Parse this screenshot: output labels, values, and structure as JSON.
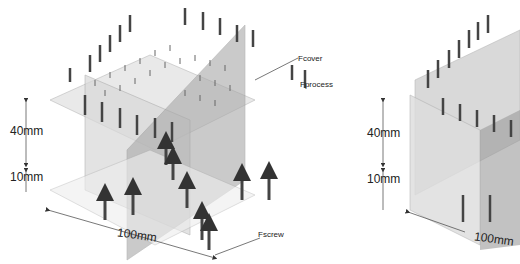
{
  "left_figure": {
    "dimensions": {
      "height_top": "40mm",
      "height_bottom": "10mm",
      "width": "100mm"
    },
    "forces": {
      "cover": "Fcover",
      "process": "Fprocess",
      "screw": "Fscrew"
    }
  },
  "right_figure": {
    "dimensions": {
      "height_top": "40mm",
      "height_bottom": "10mm",
      "width": "100mm"
    }
  },
  "colors": {
    "arrow": "#444444",
    "plane": "#cfcfcf",
    "plane_dark": "#9a9a9a",
    "line": "#888888"
  }
}
